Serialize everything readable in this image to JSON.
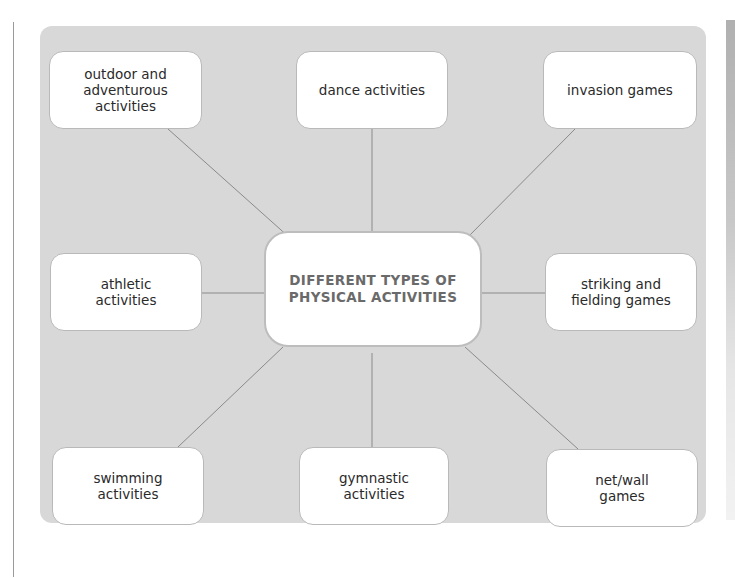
{
  "diagram": {
    "type": "mind-map",
    "colors": {
      "panel_background": "#d8d8d8",
      "node_background": "#ffffff",
      "node_border": "#b9b9b9",
      "connector": "#8a8a8a",
      "center_text": "#6a6a6a",
      "node_text": "#2a2a2a"
    },
    "center": {
      "label": "DIFFERENT TYPES OF\nPHYSICAL ACTIVITIES"
    },
    "nodes": [
      {
        "id": "outdoor",
        "label": "outdoor and\nadventurous\nactivities"
      },
      {
        "id": "dance",
        "label": "dance activities"
      },
      {
        "id": "invasion",
        "label": "invasion games"
      },
      {
        "id": "athletic",
        "label": "athletic\nactivities"
      },
      {
        "id": "striking",
        "label": "striking and\nfielding games"
      },
      {
        "id": "swimming",
        "label": "swimming\nactivities"
      },
      {
        "id": "gymnastic",
        "label": "gymnastic\nactivities"
      },
      {
        "id": "netwall",
        "label": "net/wall\ngames"
      }
    ]
  }
}
